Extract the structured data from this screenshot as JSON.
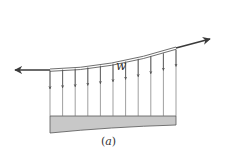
{
  "figure": {
    "load_label": "w",
    "caption_open": "(",
    "caption_letter": "a",
    "caption_close": ")"
  },
  "colors": {
    "line": "#555555",
    "cable": "#4a4a4a",
    "deck_fill": "#c8c8c8",
    "deck_stroke": "#555555",
    "text": "#333333"
  },
  "hangers": {
    "count": 11,
    "x_positions": [
      50,
      62.6,
      75.2,
      87.8,
      100.4,
      113,
      125.6,
      138.2,
      150.8,
      163.4,
      176
    ]
  }
}
